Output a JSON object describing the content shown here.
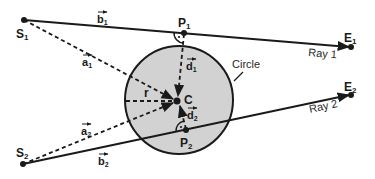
{
  "diagram": {
    "type": "ray-circle intersection geometry",
    "colors": {
      "circle_fill": "#d2d2d2",
      "stroke": "#1a1a1a",
      "background": "#ffffff"
    },
    "circle": {
      "label": "Circle",
      "center_label": "C",
      "radius_label": "r",
      "cx": 179,
      "cy": 100,
      "r": 54
    },
    "points": {
      "S1": {
        "label": "S",
        "sub": "1",
        "x": 24,
        "y": 20
      },
      "P1": {
        "label": "P",
        "sub": "1",
        "x": 184,
        "y": 33
      },
      "E1": {
        "label": "E",
        "sub": "1",
        "x": 351,
        "y": 47
      },
      "S2": {
        "label": "S",
        "sub": "2",
        "x": 23,
        "y": 164
      },
      "P2": {
        "label": "P",
        "sub": "2",
        "x": 186,
        "y": 130
      },
      "E2": {
        "label": "E",
        "sub": "2",
        "x": 351,
        "y": 95
      },
      "C": {
        "label": "C",
        "x": 177,
        "y": 101
      }
    },
    "rays": [
      {
        "name": "Ray 1",
        "label": "Ray 1",
        "from": "S1",
        "to": "E1"
      },
      {
        "name": "Ray 2",
        "label": "Ray 2",
        "from": "S2",
        "to": "E2"
      }
    ],
    "vectors": {
      "a1": {
        "base": "a",
        "sub": "1"
      },
      "b1": {
        "base": "b",
        "sub": "1"
      },
      "d1": {
        "base": "d",
        "sub": "1"
      },
      "a2": {
        "base": "a",
        "sub": "2"
      },
      "b2": {
        "base": "b",
        "sub": "2"
      },
      "d2": {
        "base": "d",
        "sub": "2"
      }
    }
  }
}
